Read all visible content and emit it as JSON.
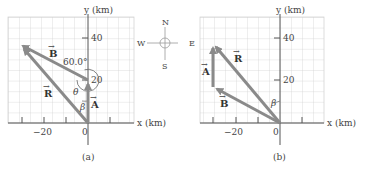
{
  "panel_a": {
    "caption": "(a)",
    "x_axis_label": "x (km)",
    "y_axis_label": "y (km)",
    "x_ticks": [
      "−20",
      "0"
    ],
    "y_ticks": [
      "20",
      "40"
    ],
    "vectors": {
      "A": "A",
      "B": "B",
      "R": "R"
    },
    "angle_label": "60.0°",
    "theta": "θ",
    "beta": "β"
  },
  "panel_b": {
    "caption": "(b)",
    "x_axis_label": "x (km)",
    "y_axis_label": "y (km)",
    "x_ticks": [
      "−20",
      "0"
    ],
    "y_ticks": [
      "20",
      "40"
    ],
    "vectors": {
      "A": "A",
      "B": "B",
      "R": "R"
    },
    "beta": "β"
  },
  "compass": {
    "N": "N",
    "S": "S",
    "E": "E",
    "W": "W"
  },
  "colors": {
    "vector": "#8a8a8a",
    "grid": "#c9c9c9",
    "axis": "#555555",
    "circle": "#e07a6a"
  }
}
